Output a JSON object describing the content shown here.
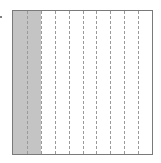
{
  "diagram": {
    "type": "fraction-area-model",
    "total_columns": 10,
    "shaded_columns": 2,
    "fraction_shaded": "2/10",
    "orientation": "vertical-strips",
    "divider_style": "dashed",
    "colors": {
      "shade": "#c4c4c4",
      "border": "#7a7a7a",
      "divider": "#9a9a9a",
      "background": "#ffffff"
    }
  }
}
